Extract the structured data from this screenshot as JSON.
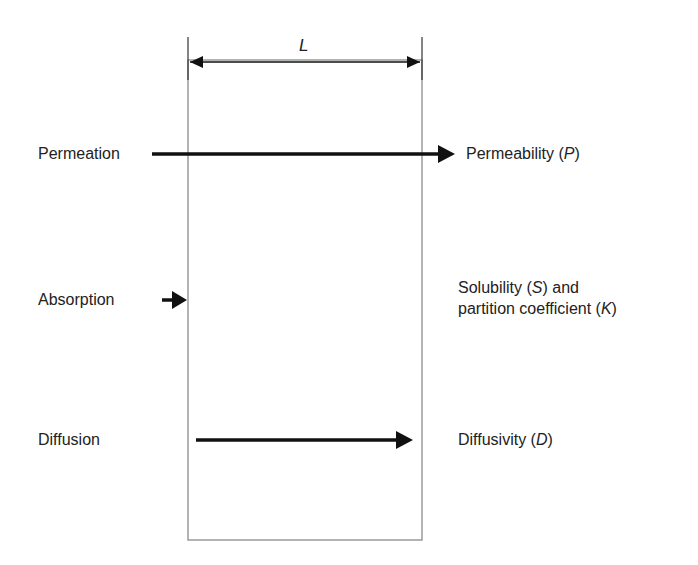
{
  "diagram": {
    "membrane": {
      "thickness_label": "L",
      "border_color": "#9a9a9a"
    },
    "processes": [
      {
        "name": "Permeation",
        "property": "Permeability",
        "symbol": "P"
      },
      {
        "name": "Absorption",
        "property_line1": "Solubility",
        "symbol1": "S",
        "connector": "and",
        "property_line2": "partition coefficient",
        "symbol2": "K"
      },
      {
        "name": "Diffusion",
        "property": "Diffusivity",
        "symbol": "D"
      }
    ],
    "arrow_color": "#111111"
  }
}
